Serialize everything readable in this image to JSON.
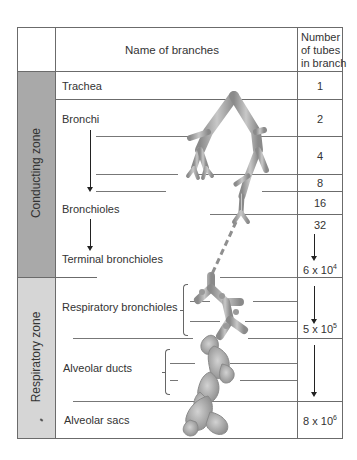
{
  "header": {
    "names_col": "Name of branches",
    "number_col_line1": "Number",
    "number_col_line2": "of tubes",
    "number_col_line3": "in branch"
  },
  "zones": {
    "conducting": "Conducting zone",
    "respiratory": "Respiratory zone"
  },
  "branches": {
    "trachea": "Trachea",
    "bronchi": "Bronchi",
    "bronchioles": "Bronchioles",
    "terminal_bronchioles": "Terminal bronchioles",
    "respiratory_bronchioles": "Respiratory bronchioles",
    "alveolar_ducts": "Alveolar ducts",
    "alveolar_sacs": "Alveolar sacs"
  },
  "numbers": {
    "trachea": "1",
    "bronchi": "2",
    "gen2": "4",
    "gen3": "8",
    "bronchioles": "16",
    "gen5": "32",
    "terminal_base": "6 x 10",
    "terminal_exp": "4",
    "respiratory_base": "5 x 10",
    "respiratory_exp": "5",
    "sacs_base": "8 x 10",
    "sacs_exp": "6"
  },
  "colors": {
    "conducting_zone_fill": "#a9a9a9",
    "respiratory_zone_fill": "#d6d6d6",
    "border": "#6b6b6b",
    "airway": "#9a9a9a"
  }
}
